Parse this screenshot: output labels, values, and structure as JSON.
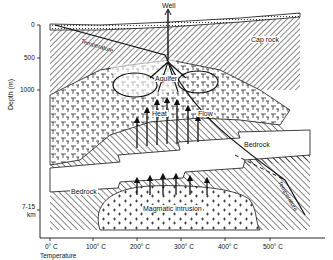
{
  "diagram": {
    "labels": {
      "well": "Well",
      "cap_rock": "Cap rock",
      "aquifer": "Aquifer",
      "heat": "Heat",
      "flow": "Flow",
      "bedrock_upper": "Bedrock",
      "bedrock_lower": "Bedrock",
      "magmatic_intrusion": "Magmatic intrusion",
      "temperature_curve_top": "Temperature",
      "temperature_curve_right": "Temperature"
    },
    "y_axis": {
      "label": "Depth (m)",
      "ticks": [
        "0",
        "500",
        "1000",
        "7-15",
        "km"
      ]
    },
    "x_axis": {
      "label": "Temperature",
      "ticks": [
        "0° C",
        "100° C",
        "200° C",
        "300° C",
        "400° C",
        "500° C"
      ]
    },
    "colors": {
      "ink": "#111111",
      "background": "#ffffff"
    }
  }
}
